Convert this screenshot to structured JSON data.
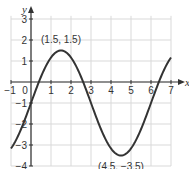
{
  "chart_data": {
    "type": "line",
    "title": "",
    "xlabel": "x",
    "ylabel": "y",
    "xlim": [
      -1,
      7
    ],
    "ylim": [
      -4,
      3
    ],
    "grid": true,
    "x_ticks": [
      "-1",
      "0",
      "1",
      "2",
      "3",
      "4",
      "5",
      "6",
      "7"
    ],
    "y_ticks": [
      "3",
      "2",
      "1",
      "-1",
      "-2",
      "-3",
      "-4"
    ],
    "function": "y = -1 + 2.5 sin(pi x / 3)",
    "series": [
      {
        "name": "curve",
        "x": [
          -1,
          -0.5,
          0,
          0.5,
          1,
          1.5,
          2,
          2.5,
          3,
          3.5,
          4,
          4.5,
          5,
          5.5,
          6,
          6.5,
          7
        ],
        "y": [
          -3.17,
          -2.25,
          -1,
          0.25,
          1.17,
          1.5,
          1.17,
          0.25,
          -1,
          -2.25,
          -3.17,
          -3.5,
          -3.17,
          -2.25,
          -1,
          0.25,
          1.17
        ]
      }
    ],
    "annotations": [
      {
        "label": "(1.5, 1.5)",
        "x": 1.5,
        "y": 1.5
      },
      {
        "label": "(4.5, −3.5)",
        "x": 4.5,
        "y": -3.5
      }
    ],
    "colors": {
      "curve": "#333333",
      "grid": "#d9d9d9",
      "axis": "#333333"
    }
  }
}
